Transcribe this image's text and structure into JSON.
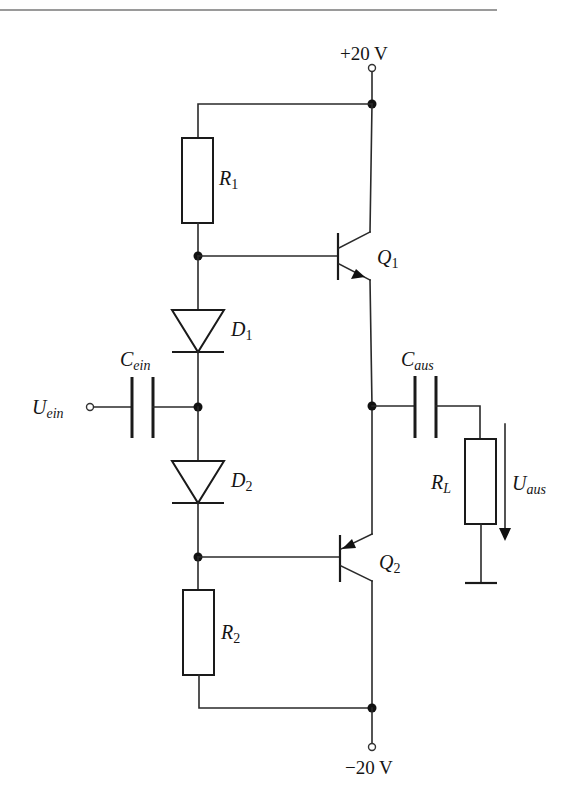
{
  "diagram": {
    "type": "circuit-schematic",
    "colors": {
      "ink": "#1a1a1a",
      "background": "#ffffff",
      "rule": "#9a9a9a"
    }
  },
  "supplies": {
    "positive": {
      "label": "+20 V"
    },
    "negative": {
      "label": "−20 V"
    }
  },
  "components": {
    "R1": {
      "symbol": "R",
      "sub": "1",
      "kind": "resistor"
    },
    "R2": {
      "symbol": "R",
      "sub": "2",
      "kind": "resistor"
    },
    "RL": {
      "symbol": "R",
      "sub": "L",
      "kind": "load-resistor"
    },
    "D1": {
      "symbol": "D",
      "sub": "1",
      "kind": "diode"
    },
    "D2": {
      "symbol": "D",
      "sub": "2",
      "kind": "diode"
    },
    "Q1": {
      "symbol": "Q",
      "sub": "1",
      "kind": "npn-transistor"
    },
    "Q2": {
      "symbol": "Q",
      "sub": "2",
      "kind": "pnp-transistor"
    },
    "Cein": {
      "symbol": "C",
      "sub": "ein",
      "kind": "input-coupling-capacitor"
    },
    "Caus": {
      "symbol": "C",
      "sub": "aus",
      "kind": "output-coupling-capacitor"
    }
  },
  "signals": {
    "input": {
      "symbol": "U",
      "sub": "ein"
    },
    "output": {
      "symbol": "U",
      "sub": "aus"
    }
  }
}
